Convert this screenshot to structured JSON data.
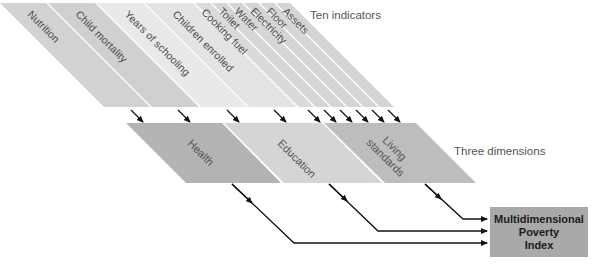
{
  "captions": {
    "indicators": "Ten indicators",
    "dimensions": "Three dimensions"
  },
  "indicators": [
    {
      "label": "Nutrition",
      "color": "#d2d2d2"
    },
    {
      "label": "Child mortality",
      "color": "#d2d2d2"
    },
    {
      "label": "Years of schooling",
      "color": "#e9e9e9"
    },
    {
      "label": "Children enrolled",
      "color": "#e4e4e4"
    },
    {
      "label": "Cooking fuel",
      "color": "#d9d9d9"
    },
    {
      "label": "Toilet",
      "color": "#d6d6d6"
    },
    {
      "label": "Water",
      "color": "#d6d6d6"
    },
    {
      "label": "Electricity",
      "color": "#d6d6d6"
    },
    {
      "label": "Floor",
      "color": "#d6d6d6"
    },
    {
      "label": "Assets",
      "color": "#d6d6d6"
    }
  ],
  "dimensions": [
    {
      "label": "Health",
      "color": "#b3b3b3"
    },
    {
      "label": "Education",
      "color": "#d6d6d6"
    },
    {
      "label": "Living standards",
      "line1": "Living",
      "line2": "standards",
      "color": "#bdbdbd"
    }
  ],
  "output": {
    "line1": "Multidimensional",
    "line2": "Poverty",
    "line3": "Index",
    "color": "#a9a9a9"
  }
}
